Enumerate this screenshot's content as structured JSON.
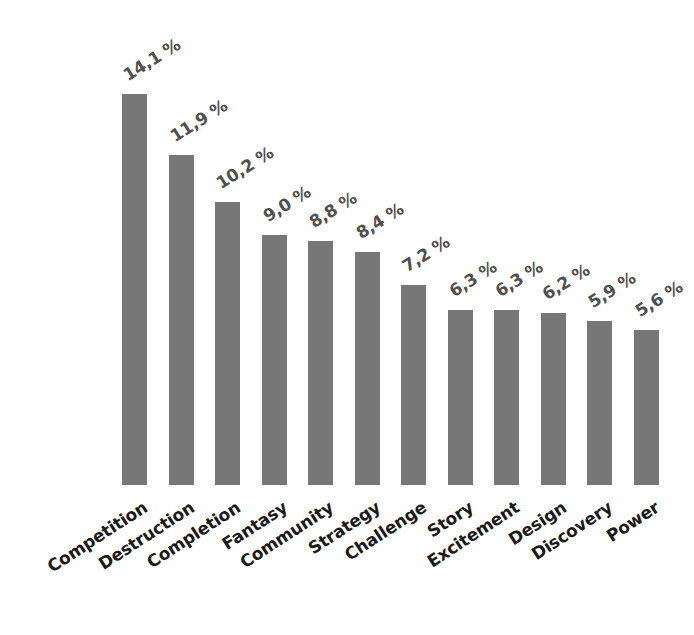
{
  "chart_data": {
    "type": "bar",
    "title": "",
    "subtitle": "",
    "xlabel": "",
    "ylabel": "",
    "grid": false,
    "legend": false,
    "axis_visible": false,
    "orientation": "vertical",
    "decimal_separator": ",",
    "value_suffix": "%",
    "ylim": [
      0,
      14.1
    ],
    "bar_color": "#777777",
    "value_label_color": "#4f4f4f",
    "category_label_color": "#1a1a1a",
    "background_color": "#ffffff",
    "categories": [
      "Competition",
      "Destruction",
      "Completion",
      "Fantasy",
      "Community",
      "Strategy",
      "Challenge",
      "Story",
      "Excitement",
      "Design",
      "Discovery",
      "Power"
    ],
    "values": [
      14.1,
      11.9,
      10.2,
      9.0,
      8.8,
      8.4,
      7.2,
      6.3,
      6.3,
      6.2,
      5.9,
      5.6
    ],
    "value_labels": [
      "14,1 %",
      "11,9 %",
      "10,2 %",
      "9,0 %",
      "8,8 %",
      "8,4 %",
      "7,2 %",
      "6,3 %",
      "6,3 %",
      "6,2 %",
      "5,9 %",
      "5,6 %"
    ]
  }
}
